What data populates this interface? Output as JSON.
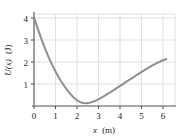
{
  "figure": {
    "name": "potential-energy-graph",
    "background": "#ffffff"
  },
  "chart_data": {
    "type": "line",
    "title": "",
    "xlabel": "x (m)",
    "ylabel": "U(x) (J)",
    "xlabel_symbol": "x",
    "xlabel_unit": "(m)",
    "ylabel_symbol": "U(x)",
    "ylabel_unit": "(J)",
    "xlim": [
      0,
      6.4
    ],
    "ylim": [
      0,
      4.35
    ],
    "xticks": [
      0,
      1,
      2,
      3,
      4,
      5,
      6
    ],
    "xticklabels": [
      "0",
      "1",
      "2",
      "3",
      "4",
      "5",
      "6"
    ],
    "yticks": [
      1,
      2,
      3,
      4
    ],
    "yticklabels": [
      "1",
      "2",
      "3",
      "4"
    ],
    "grid": true,
    "grid_color": "#d8d8d8",
    "axis_color": "#8a8a8a",
    "legend": null,
    "series": [
      {
        "name": "U(x)",
        "color": "#8f8f8f",
        "linewidth": 2.0,
        "x": [
          0.0,
          0.15,
          0.3,
          0.45,
          0.6,
          0.75,
          0.9,
          1.05,
          1.2,
          1.35,
          1.5,
          1.65,
          1.8,
          1.95,
          2.1,
          2.25,
          2.4,
          2.55,
          2.7,
          2.85,
          3.0,
          3.2,
          3.4,
          3.6,
          3.8,
          4.0,
          4.2,
          4.4,
          4.6,
          4.8,
          5.0,
          5.2,
          5.4,
          5.6,
          5.8,
          6.0
        ],
        "y": [
          4.2,
          3.72,
          3.27,
          2.85,
          2.47,
          2.11,
          1.79,
          1.49,
          1.22,
          0.98,
          0.76,
          0.57,
          0.4,
          0.27,
          0.18,
          0.14,
          0.13,
          0.16,
          0.21,
          0.28,
          0.36,
          0.48,
          0.61,
          0.74,
          0.88,
          1.01,
          1.15,
          1.28,
          1.42,
          1.55,
          1.68,
          1.81,
          1.93,
          2.04,
          2.14,
          2.22
        ]
      }
    ],
    "annotations": {
      "minimum_x": 2.0,
      "minimum_y": 0.13,
      "start_value": 4.2,
      "end_value": 2.2
    }
  }
}
